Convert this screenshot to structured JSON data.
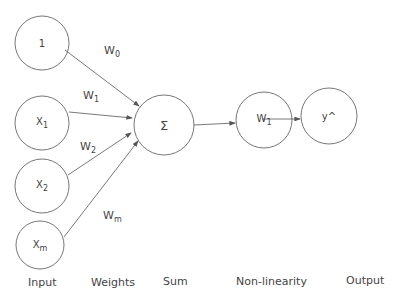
{
  "diagram": {
    "type": "perceptron",
    "input_nodes": [
      {
        "label": "1",
        "sub": ""
      },
      {
        "label": "X",
        "sub": "1"
      },
      {
        "label": "X",
        "sub": "2"
      },
      {
        "label": "X",
        "sub": "m"
      }
    ],
    "weights": [
      {
        "label": "W",
        "sub": "0"
      },
      {
        "label": "W",
        "sub": "1"
      },
      {
        "label": "W",
        "sub": "2"
      },
      {
        "label": "W",
        "sub": "m"
      }
    ],
    "sum_node": {
      "label": "Σ"
    },
    "nonlinearity_node": {
      "label": "W",
      "sub": "1"
    },
    "output_node": {
      "label": "y^"
    },
    "stage_labels": {
      "input": "Input",
      "weights": "Weights",
      "sum": "Sum",
      "nonlinearity": "Non-linearity",
      "output": "Output"
    },
    "colors": {
      "stroke": "#555555",
      "text": "#444444",
      "background": "#ffffff"
    }
  }
}
